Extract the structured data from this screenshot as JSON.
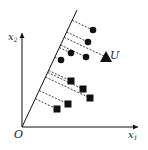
{
  "diagram": {
    "type": "projection-onto-line",
    "axes": {
      "x_label": "x",
      "x_sub": "1",
      "y_label": "x",
      "y_sub": "2",
      "origin_label": "O"
    },
    "line": {
      "from": [
        22,
        127
      ],
      "to": [
        77,
        10
      ]
    },
    "unknown_label": "U",
    "unknown_point": {
      "x": 106,
      "y": 57,
      "shape": "triangle"
    },
    "circles": [
      {
        "x": 93,
        "y": 30
      },
      {
        "x": 88,
        "y": 42
      },
      {
        "x": 71,
        "y": 53
      },
      {
        "x": 86,
        "y": 57
      },
      {
        "x": 61,
        "y": 60
      }
    ],
    "squares": [
      {
        "x": 71,
        "y": 81
      },
      {
        "x": 83,
        "y": 89
      },
      {
        "x": 90,
        "y": 98
      },
      {
        "x": 68,
        "y": 104
      },
      {
        "x": 57,
        "y": 109
      }
    ],
    "colors": {
      "ink": "#111111",
      "background": "#ffffff"
    }
  }
}
